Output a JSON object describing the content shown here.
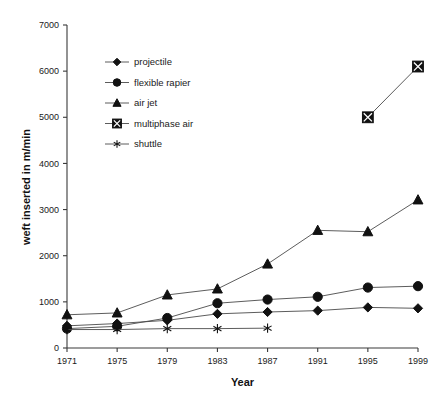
{
  "chart_data": {
    "type": "line",
    "title": "",
    "xlabel": "Year",
    "ylabel": "weft inserted in m/min",
    "x": [
      1971,
      1975,
      1979,
      1983,
      1987,
      1991,
      1995,
      1999
    ],
    "xtick_labels": [
      "1971",
      "1975",
      "1979",
      "1983",
      "1987",
      "1991",
      "1995",
      "1999"
    ],
    "ytick_labels": [
      "0",
      "1000",
      "2000",
      "3000",
      "4000",
      "5000",
      "6000",
      "7000"
    ],
    "yticks": [
      0,
      1000,
      2000,
      3000,
      4000,
      5000,
      6000,
      7000
    ],
    "xlim": [
      1971,
      1999
    ],
    "ylim": [
      0,
      7000
    ],
    "grid": false,
    "legend_position": "upper-left",
    "series": [
      {
        "name": "projectile",
        "marker": "diamond",
        "x": [
          1971,
          1975,
          1979,
          1983,
          1987,
          1991,
          1995,
          1999
        ],
        "values": [
          480,
          530,
          600,
          740,
          780,
          810,
          880,
          860
        ]
      },
      {
        "name": "flexible rapier",
        "marker": "circle",
        "x": [
          1971,
          1975,
          1979,
          1983,
          1987,
          1991,
          1995,
          1999
        ],
        "values": [
          420,
          470,
          650,
          970,
          1050,
          1110,
          1310,
          1340
        ]
      },
      {
        "name": "air jet",
        "marker": "triangle",
        "x": [
          1971,
          1975,
          1979,
          1983,
          1987,
          1991,
          1995,
          1999
        ],
        "values": [
          720,
          760,
          1150,
          1280,
          1820,
          2550,
          2520,
          3210
        ]
      },
      {
        "name": "multiphase air",
        "marker": "crossed-square",
        "x": [
          1995,
          1999
        ],
        "values": [
          5000,
          6100
        ]
      },
      {
        "name": "shuttle",
        "marker": "asterisk",
        "x": [
          1971,
          1975,
          1979,
          1983,
          1987
        ],
        "values": [
          400,
          400,
          420,
          420,
          430
        ]
      }
    ]
  },
  "legend": {
    "items": [
      {
        "label": "projectile",
        "marker": "diamond"
      },
      {
        "label": "flexible rapier",
        "marker": "circle"
      },
      {
        "label": "air jet",
        "marker": "triangle"
      },
      {
        "label": "multiphase air",
        "marker": "crossed-square"
      },
      {
        "label": "shuttle",
        "marker": "asterisk"
      }
    ]
  }
}
